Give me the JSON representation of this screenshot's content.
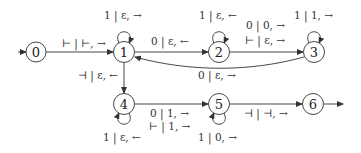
{
  "diagram": {
    "type": "state-machine",
    "nodes": [
      {
        "id": "0",
        "label": "0",
        "x": 36,
        "y": 52
      },
      {
        "id": "1",
        "label": "1",
        "x": 124,
        "y": 52
      },
      {
        "id": "2",
        "label": "2",
        "x": 219,
        "y": 52
      },
      {
        "id": "3",
        "label": "3",
        "x": 314,
        "y": 52
      },
      {
        "id": "4",
        "label": "4",
        "x": 124,
        "y": 104
      },
      {
        "id": "5",
        "label": "5",
        "x": 219,
        "y": 104
      },
      {
        "id": "6",
        "label": "6",
        "x": 313,
        "y": 104
      }
    ],
    "edges": [
      {
        "from": "start",
        "to": "0",
        "label": ""
      },
      {
        "from": "0",
        "to": "1",
        "label": "⊢ | ⊢, →"
      },
      {
        "from": "1",
        "to": "1",
        "label": "1 | ε, →"
      },
      {
        "from": "1",
        "to": "2",
        "label": "0 | ε, ←"
      },
      {
        "from": "2",
        "to": "2",
        "label": "1 | ε, ←"
      },
      {
        "from": "2",
        "to": "3",
        "label_lines": [
          "0 | 0, →",
          "⊢ | ε, →"
        ]
      },
      {
        "from": "3",
        "to": "3",
        "label": "1 | 1, →"
      },
      {
        "from": "3",
        "to": "1",
        "label": "0 | ε, →"
      },
      {
        "from": "1",
        "to": "4",
        "label": "⊣ | ε, ←"
      },
      {
        "from": "4",
        "to": "4",
        "label": "1 | ε, ←"
      },
      {
        "from": "4",
        "to": "5",
        "label_lines": [
          "0 | 1, →",
          "⊢ | 1, →"
        ]
      },
      {
        "from": "5",
        "to": "5",
        "label": "1 | 0, →"
      },
      {
        "from": "5",
        "to": "6",
        "label": "⊣ | ⊣, →"
      },
      {
        "from": "6",
        "to": "accept",
        "label": ""
      }
    ]
  },
  "labels": {
    "e01": "⊢ | ⊢, →",
    "e11": "1 | ε, →",
    "e12": "0 | ε, ←",
    "e22": "1 | ε, ←",
    "e23a": "0 | 0, →",
    "e23b": "⊢ | ε, →",
    "e33": "1 | 1, →",
    "e31": "0 | ε, →",
    "e14": "⊣ | ε, ←",
    "e44": "1 | ε, ←",
    "e45a": "0 | 1, →",
    "e45b": "⊢ | 1, →",
    "e55": "1 | 0, →",
    "e56": "⊣ | ⊣, →"
  },
  "node_labels": {
    "n0": "0",
    "n1": "1",
    "n2": "2",
    "n3": "3",
    "n4": "4",
    "n5": "5",
    "n6": "6"
  }
}
